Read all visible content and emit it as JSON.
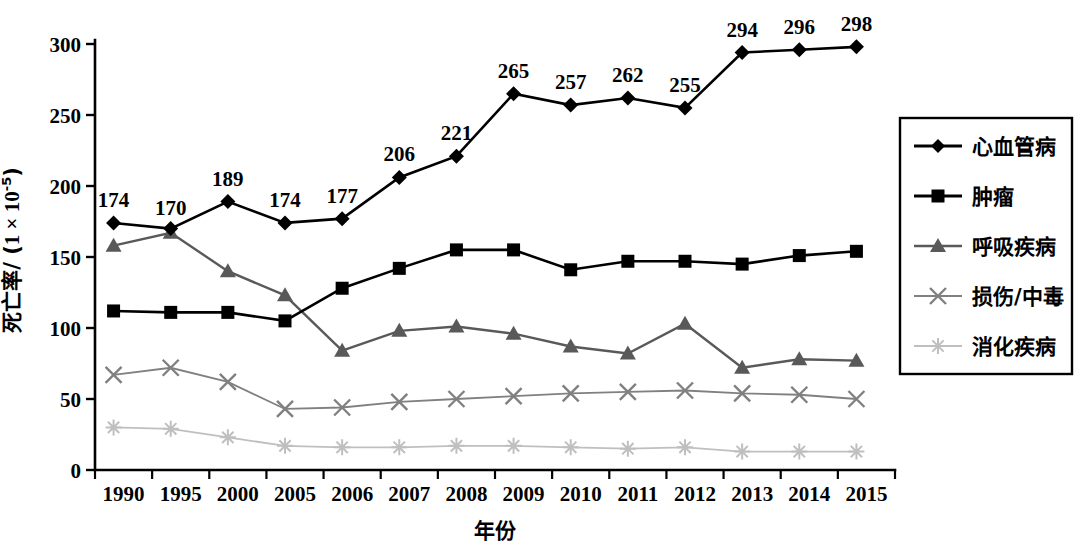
{
  "chart_data": {
    "type": "line",
    "title": "",
    "xlabel": "年份",
    "ylabel": "死亡率/（1×10⁻⁵）",
    "ylabel_parts": {
      "name": "死亡率",
      "sep": "/ (",
      "unit_base": "1 × 10",
      "unit_exp": "-5",
      "close": ")"
    },
    "categories": [
      "1990",
      "1995",
      "2000",
      "2005",
      "2006",
      "2007",
      "2008",
      "2009",
      "2010",
      "2011",
      "2012",
      "2013",
      "2014",
      "2015"
    ],
    "ylim": [
      0,
      300
    ],
    "yticks": [
      0,
      50,
      100,
      150,
      200,
      250,
      300
    ],
    "grid": false,
    "legend_position": "right",
    "series": [
      {
        "name": "心血管病",
        "marker": "diamond",
        "color": "#000000",
        "labeled": true,
        "values": [
          174,
          170,
          189,
          174,
          177,
          206,
          221,
          265,
          257,
          262,
          255,
          294,
          296,
          298
        ]
      },
      {
        "name": "肿瘤",
        "marker": "square",
        "color": "#000000",
        "labeled": false,
        "values": [
          112,
          111,
          111,
          105,
          128,
          142,
          155,
          155,
          141,
          147,
          147,
          145,
          151,
          154
        ]
      },
      {
        "name": "呼吸疾病",
        "marker": "triangle",
        "color": "#595959",
        "labeled": false,
        "values": [
          158,
          167,
          140,
          123,
          84,
          98,
          101,
          96,
          87,
          82,
          103,
          72,
          78,
          77
        ]
      },
      {
        "name": "损伤/中毒",
        "marker": "x-cross",
        "color": "#808080",
        "labeled": false,
        "values": [
          67,
          72,
          62,
          43,
          44,
          48,
          50,
          52,
          54,
          55,
          56,
          54,
          53,
          50
        ]
      },
      {
        "name": "消化疾病",
        "marker": "asterisk",
        "color": "#bfbfbf",
        "labeled": false,
        "values": [
          30,
          29,
          23,
          17,
          16,
          16,
          17,
          17,
          16,
          15,
          16,
          13,
          13,
          13
        ]
      }
    ]
  },
  "axes": {
    "x_tick_labels": [
      "1990",
      "1995",
      "2000",
      "2005",
      "2006",
      "2007",
      "2008",
      "2009",
      "2010",
      "2011",
      "2012",
      "2013",
      "2014",
      "2015"
    ],
    "y_tick_labels": [
      "0",
      "50",
      "100",
      "150",
      "200",
      "250",
      "300"
    ]
  },
  "legend": {
    "items": [
      {
        "label": "心血管病",
        "marker": "diamond",
        "color": "#000000"
      },
      {
        "label": "肿瘤",
        "marker": "square",
        "color": "#000000"
      },
      {
        "label": "呼吸疾病",
        "marker": "triangle",
        "color": "#595959"
      },
      {
        "label": "损伤/中毒",
        "marker": "x-cross",
        "color": "#808080"
      },
      {
        "label": "消化疾病",
        "marker": "asterisk",
        "color": "#bfbfbf"
      }
    ]
  }
}
